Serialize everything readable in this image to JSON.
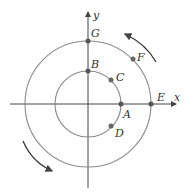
{
  "diagram": {
    "axes": {
      "x_label": "x",
      "y_label": "y"
    },
    "points": {
      "A": "A",
      "B": "B",
      "C": "C",
      "D": "D",
      "E": "E",
      "F": "F",
      "G": "G"
    },
    "circles": [
      {
        "name": "inner",
        "points": [
          "A",
          "B",
          "C",
          "D"
        ]
      },
      {
        "name": "outer",
        "points": [
          "E",
          "F",
          "G"
        ]
      }
    ],
    "arrows": [
      "counterclockwise (upper right)",
      "counterclockwise (lower left)"
    ],
    "colors": {
      "circle": "#8a8a8a",
      "axis": "#444444",
      "point": "#555555"
    }
  }
}
